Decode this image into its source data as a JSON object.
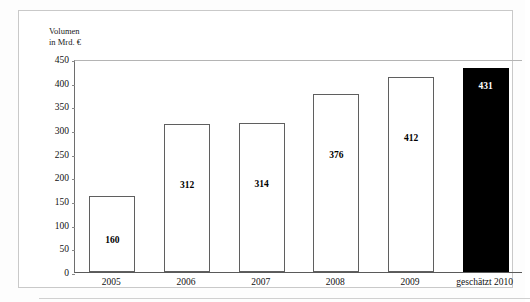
{
  "chart_data": {
    "type": "bar",
    "title": "",
    "subtitle": "",
    "xlabel": "",
    "ylabel": "Volumen in Mrd. €",
    "ylabel_lines": [
      "Volumen",
      "in Mrd. €"
    ],
    "categories": [
      "2005",
      "2006",
      "2007",
      "2008",
      "2009",
      "geschätzt 2010"
    ],
    "values": [
      160,
      312,
      314,
      376,
      412,
      431
    ],
    "value_labels": [
      "160",
      "312",
      "314",
      "376",
      "412",
      "431"
    ],
    "ylim": [
      0,
      450
    ],
    "ytick_labels": [
      "450",
      "400",
      "350",
      "300",
      "250",
      "200",
      "150",
      "100",
      "50",
      "0"
    ],
    "ytick_values": [
      450,
      400,
      350,
      300,
      250,
      200,
      150,
      100,
      50,
      0
    ],
    "grid": false,
    "legend": null,
    "bar_colors": [
      "#ffffff",
      "#ffffff",
      "#ffffff",
      "#ffffff",
      "#ffffff",
      "#000000"
    ],
    "bar_edge_color": "#5f5f5f",
    "highlight_index": 5,
    "highlight_note": "letzter Balken (Prognose) schwarz gefüllt"
  },
  "figure": {
    "watermark_text": "",
    "background_color": "#ffffff",
    "frame_color": "#c9c9c9",
    "axis_color": "#5a5a5a",
    "text_color": "#111111"
  }
}
